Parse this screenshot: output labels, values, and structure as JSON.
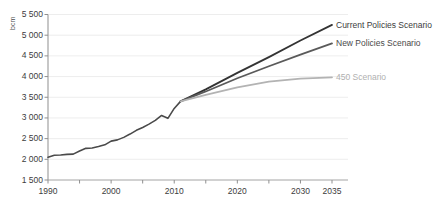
{
  "chart_data": {
    "type": "line",
    "title": "",
    "subtitle": "",
    "xlabel": "",
    "ylabel": "bcm",
    "unit": "bcm",
    "xlim": [
      1990,
      2035
    ],
    "ylim": [
      1500,
      5500
    ],
    "ytick_labels": [
      "5 500",
      "5 000",
      "4 500",
      "4 000",
      "3 500",
      "3 000",
      "2 500",
      "2 000",
      "1 500"
    ],
    "ytick_values": [
      5500,
      5000,
      4500,
      4000,
      3500,
      3000,
      2500,
      2000,
      1500
    ],
    "xtick_labels": [
      "1990",
      "2000",
      "2010",
      "2020",
      "2030",
      "2035"
    ],
    "xtick_values": [
      1990,
      2000,
      2010,
      2020,
      2030,
      2035
    ],
    "minor_xticks": [
      1995,
      2005,
      2015,
      2025
    ],
    "grid": "horizontal",
    "legend_position": "inline-right",
    "series": [
      {
        "name": "Historical",
        "color": "#4a4a4a",
        "width": 1.6,
        "label_shown": false,
        "x": [
          1990,
          1991,
          1992,
          1993,
          1994,
          1995,
          1996,
          1997,
          1998,
          1999,
          2000,
          2001,
          2002,
          2003,
          2004,
          2005,
          2006,
          2007,
          2008,
          2009,
          2010,
          2011
        ],
        "values": [
          2050,
          2100,
          2105,
          2120,
          2125,
          2200,
          2265,
          2275,
          2310,
          2350,
          2440,
          2470,
          2530,
          2610,
          2700,
          2770,
          2850,
          2940,
          3060,
          2990,
          3230,
          3400
        ]
      },
      {
        "name": "Current Policies Scenario",
        "color": "#333333",
        "width": 1.8,
        "label_shown": true,
        "label_color": "#3c3c3c",
        "x": [
          2011,
          2015,
          2020,
          2025,
          2030,
          2035
        ],
        "values": [
          3400,
          3690,
          4090,
          4470,
          4870,
          5250
        ]
      },
      {
        "name": "New Policies Scenario",
        "color": "#5a5a5a",
        "width": 1.8,
        "label_shown": true,
        "label_color": "#4a4a4a",
        "x": [
          2011,
          2015,
          2020,
          2025,
          2030,
          2035
        ],
        "values": [
          3400,
          3640,
          3960,
          4250,
          4530,
          4800
        ]
      },
      {
        "name": "450 Scenario",
        "color": "#b3b3b3",
        "width": 1.8,
        "label_shown": true,
        "label_color": "#b0b0b0",
        "x": [
          2011,
          2015,
          2020,
          2025,
          2030,
          2035
        ],
        "values": [
          3400,
          3560,
          3740,
          3880,
          3950,
          3980
        ]
      }
    ]
  },
  "labels": {
    "current_policies": "Current Policies Scenario",
    "new_policies": "New Policies Scenario",
    "scenario_450": "450 Scenario",
    "unit": "bcm"
  }
}
